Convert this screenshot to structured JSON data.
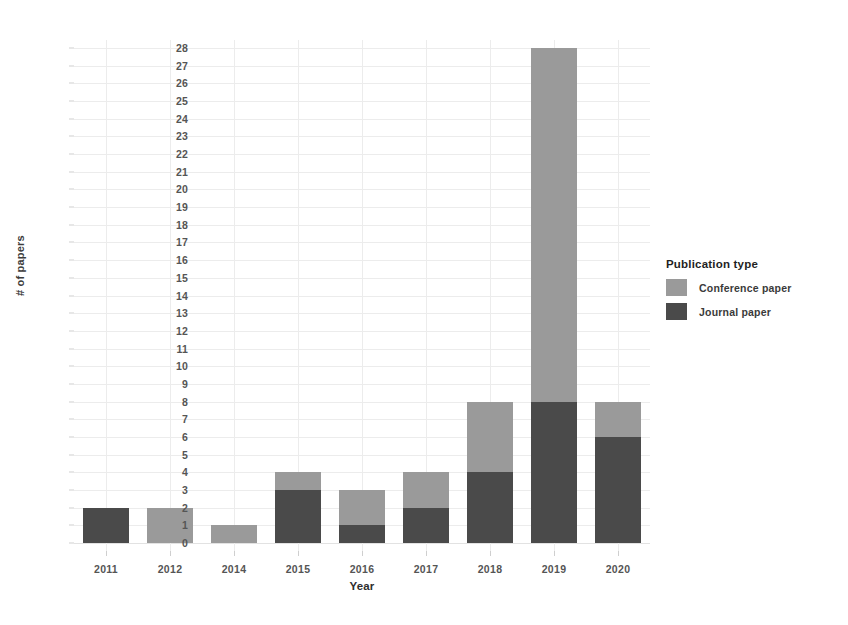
{
  "chart_data": {
    "type": "bar",
    "subtype": "stacked",
    "title": "",
    "xlabel": "Year",
    "ylabel": "# of papers",
    "categories": [
      "2011",
      "2012",
      "2014",
      "2015",
      "2016",
      "2017",
      "2018",
      "2019",
      "2020"
    ],
    "series": [
      {
        "name": "Journal paper",
        "color": "#4a4a4a",
        "values": [
          2,
          0,
          0,
          3,
          1,
          2,
          4,
          8,
          6
        ]
      },
      {
        "name": "Conference paper",
        "color": "#9a9a9a",
        "values": [
          0,
          2,
          1,
          1,
          2,
          2,
          4,
          20,
          2
        ]
      }
    ],
    "totals": [
      2,
      2,
      1,
      4,
      3,
      4,
      8,
      28,
      8
    ],
    "stack_order": [
      "Journal paper",
      "Conference paper"
    ],
    "ylim": [
      0,
      28
    ],
    "ytick_values": [
      0,
      1,
      2,
      3,
      4,
      5,
      6,
      7,
      8,
      9,
      10,
      11,
      12,
      13,
      14,
      15,
      16,
      17,
      18,
      19,
      20,
      21,
      22,
      23,
      24,
      25,
      26,
      27,
      28
    ],
    "ytick_labels": [
      "0",
      "1",
      "2",
      "3",
      "4",
      "5",
      "6",
      "7",
      "8",
      "9",
      "10",
      "11",
      "12",
      "13",
      "14",
      "15",
      "16",
      "17",
      "18",
      "19",
      "20",
      "21",
      "22",
      "23",
      "24",
      "25",
      "26",
      "27",
      "28"
    ],
    "grid": true,
    "grid_color": "#ececec",
    "background": "#ffffff",
    "legend": {
      "title": "Publication type",
      "position": "right",
      "entries": [
        {
          "label": "Conference paper",
          "color": "#9a9a9a"
        },
        {
          "label": "Journal paper",
          "color": "#4a4a4a"
        }
      ]
    }
  }
}
